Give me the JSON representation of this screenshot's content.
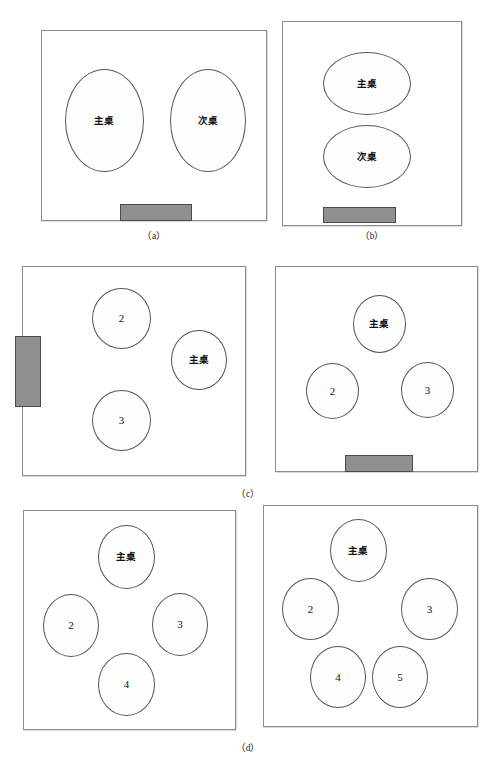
{
  "figure": {
    "background_color": "#ffffff",
    "wall_color": "#8c8c8c",
    "stage_color": "#8f8f8f",
    "stage_border_color": "#4a4a4a",
    "table_border_color": "#56565a"
  },
  "captions": [
    {
      "id": "caption-a",
      "text": "（a）"
    },
    {
      "id": "caption-b",
      "text": "（b）"
    },
    {
      "id": "caption-c",
      "text": "（c）"
    },
    {
      "id": "caption-d",
      "text": "（d）"
    }
  ],
  "panels": [
    {
      "id": "panel-a",
      "caption": "（a）",
      "tables": [
        {
          "label": "主桌",
          "kind": "cn"
        },
        {
          "label": "次桌",
          "kind": "cn"
        }
      ],
      "stage": {
        "position": "bottom",
        "present": true
      }
    },
    {
      "id": "panel-b",
      "caption": "（b）",
      "tables": [
        {
          "label": "主桌",
          "kind": "cn"
        },
        {
          "label": "次桌",
          "kind": "cn"
        }
      ],
      "stage": {
        "position": "bottom",
        "present": true
      }
    },
    {
      "id": "panel-c-left",
      "caption": "（c）",
      "tables": [
        {
          "label": "2",
          "kind": "num"
        },
        {
          "label": "主桌",
          "kind": "cn"
        },
        {
          "label": "3",
          "kind": "num"
        }
      ],
      "stage": {
        "position": "left",
        "present": true
      }
    },
    {
      "id": "panel-c-right",
      "caption": "（c）",
      "tables": [
        {
          "label": "主桌",
          "kind": "cn"
        },
        {
          "label": "2",
          "kind": "num"
        },
        {
          "label": "3",
          "kind": "num"
        }
      ],
      "stage": {
        "position": "bottom",
        "present": true
      }
    },
    {
      "id": "panel-d-left",
      "caption": "（d）",
      "tables": [
        {
          "label": "主桌",
          "kind": "cn"
        },
        {
          "label": "2",
          "kind": "num"
        },
        {
          "label": "3",
          "kind": "num"
        },
        {
          "label": "4",
          "kind": "num"
        }
      ],
      "stage": {
        "position": "none",
        "present": false
      }
    },
    {
      "id": "panel-d-right",
      "caption": "（d）",
      "tables": [
        {
          "label": "主桌",
          "kind": "cn"
        },
        {
          "label": "2",
          "kind": "num"
        },
        {
          "label": "3",
          "kind": "num"
        },
        {
          "label": "4",
          "kind": "num"
        },
        {
          "label": "5",
          "kind": "num"
        }
      ],
      "stage": {
        "position": "none",
        "present": false
      }
    }
  ],
  "labels": {
    "head_table": "主桌",
    "second_table": "次桌",
    "t2": "2",
    "t3": "3",
    "t4": "4",
    "t5": "5"
  }
}
